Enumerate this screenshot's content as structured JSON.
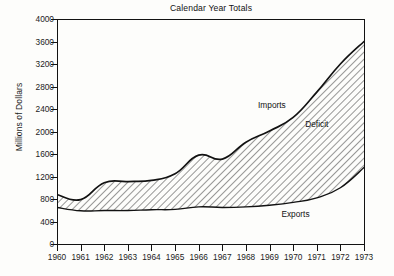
{
  "chart_data": {
    "type": "area",
    "title": "Calendar Year Totals",
    "xlabel": "",
    "ylabel": "Millions of Dollars",
    "ylim": [
      0,
      4000
    ],
    "xlim": [
      1960,
      1973
    ],
    "grid": false,
    "legend_position": "inline-annotations",
    "yticks": [
      "0",
      "400",
      "800",
      "1200",
      "1600",
      "2000",
      "2400",
      "2800",
      "3200",
      "3600",
      "4000"
    ],
    "ytick_values": [
      0,
      400,
      800,
      1200,
      1600,
      2000,
      2400,
      2800,
      3200,
      3600,
      4000
    ],
    "categories": [
      "1960",
      "1961",
      "1962",
      "1963",
      "1964",
      "1965",
      "1966",
      "1967",
      "1968",
      "1969",
      "1970",
      "1971",
      "1972",
      "1973"
    ],
    "x": [
      1960,
      1961,
      1962,
      1963,
      1964,
      1965,
      1966,
      1967,
      1968,
      1969,
      1970,
      1971,
      1972,
      1973
    ],
    "series": [
      {
        "name": "Imports",
        "values": [
          880,
          790,
          1090,
          1110,
          1130,
          1250,
          1580,
          1510,
          1810,
          2010,
          2250,
          2700,
          3200,
          3600
        ]
      },
      {
        "name": "Exports",
        "values": [
          650,
          590,
          595,
          595,
          610,
          615,
          660,
          650,
          660,
          690,
          740,
          820,
          1000,
          1360
        ]
      }
    ],
    "annotations": [
      {
        "label": "Imports",
        "x": 1969.1,
        "y": 2480
      },
      {
        "label": "Deficit",
        "x": 1971.0,
        "y": 2130
      },
      {
        "label": "Exports",
        "x": 1970.1,
        "y": 530
      }
    ],
    "fill_between": {
      "upper": "Imports",
      "lower": "Exports",
      "label": "Deficit",
      "pattern": "diagonal-hatch"
    },
    "colors": {
      "line": "#121212",
      "hatch": "#1a1a1a",
      "background": "#ffffff",
      "axis": "#121212"
    }
  }
}
